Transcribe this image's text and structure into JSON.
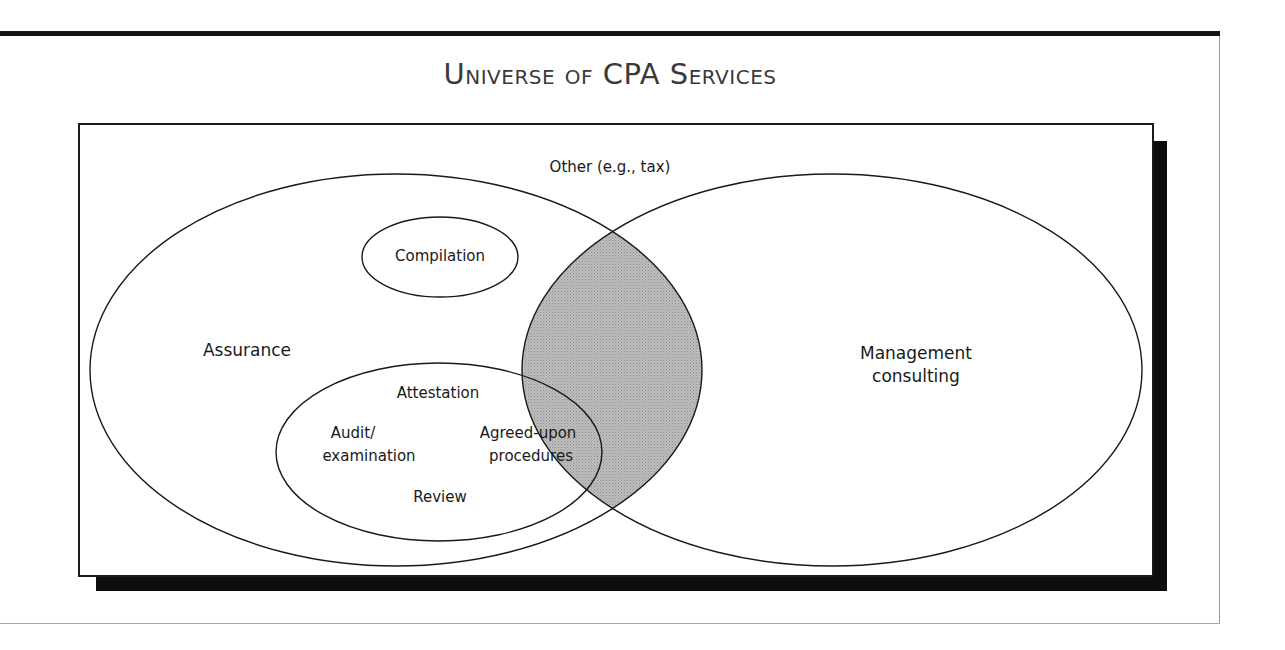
{
  "title": "Universe of CPA Services",
  "colors": {
    "overlap_fill": "#b3b3b3",
    "stroke": "#1a1a1a",
    "shadow": "#0d0d0d",
    "title_text": "#3a3a3a"
  },
  "diagram": {
    "outer_label": "Other (e.g., tax)",
    "sets": [
      {
        "id": "assurance",
        "label": "Assurance"
      },
      {
        "id": "management-consulting",
        "label_line1": "Management",
        "label_line2": "consulting"
      }
    ],
    "assurance_subsets": {
      "compilation": "Compilation",
      "attestation": {
        "label": "Attestation",
        "audit_line1": "Audit/",
        "audit_line2": "examination",
        "agreed_line1": "Agreed-upon",
        "agreed_line2": "procedures",
        "review": "Review"
      }
    },
    "overlap": "Assurance ∩ Management consulting (shaded)"
  }
}
